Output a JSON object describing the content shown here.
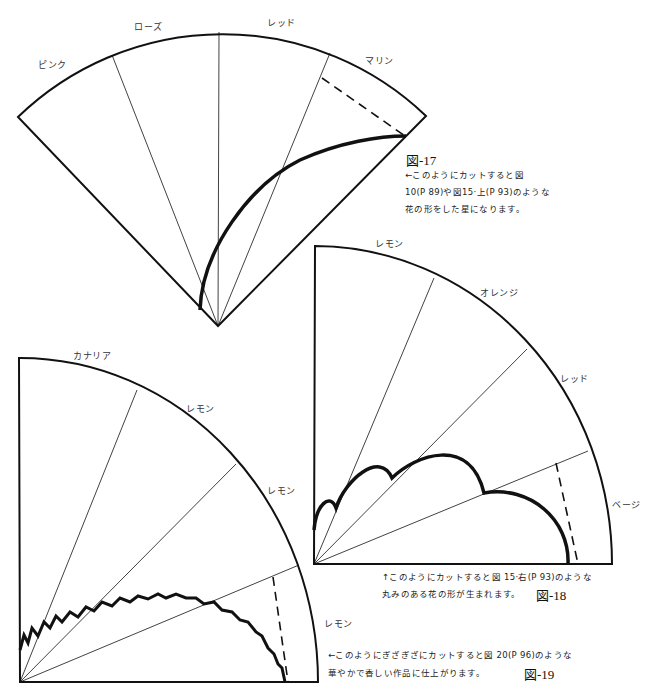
{
  "figures": [
    {
      "id": "fig17",
      "label": "図-17",
      "segments": [
        "ピンク",
        "ローズ",
        "レッド",
        "マリン"
      ],
      "caption_lines": [
        "←このようにカットすると図",
        "10(P 89)や図15·上(P 93)のような",
        "花の形をした星になります。"
      ]
    },
    {
      "id": "fig18",
      "label": "図-18",
      "segments": [
        "レモン",
        "オレンジ",
        "レッド",
        "ベージ"
      ],
      "caption_lines": [
        "↑このようにカットすると図 15·右(P 93)のような",
        "丸みのある花の形が生まれます。"
      ]
    },
    {
      "id": "fig19",
      "label": "図-19",
      "segments": [
        "カナリア",
        "レモン",
        "レモン",
        "レモン"
      ],
      "caption_lines": [
        "←このようにぎざぎざにカットすると図 20(P 96)のような",
        "華やかで香しい作品に仕上がります。"
      ]
    }
  ],
  "colors": {
    "line": "#111111",
    "background": "#ffffff"
  }
}
